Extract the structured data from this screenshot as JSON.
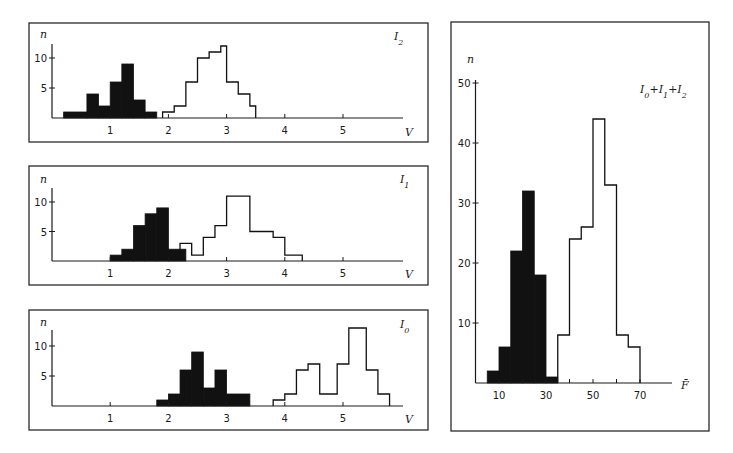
{
  "chart_data": [
    {
      "type": "bar",
      "title": "I2",
      "xlabel": "V",
      "ylabel": "n",
      "xlim": [
        0,
        6
      ],
      "ylim": [
        0,
        12
      ],
      "xticks": [
        1,
        2,
        3,
        4,
        5
      ],
      "yticks": [
        5,
        10
      ],
      "grid": false,
      "series": [
        {
          "name": "filled",
          "bins": [
            [
              0.2,
              0.6,
              1
            ],
            [
              0.6,
              0.8,
              4
            ],
            [
              0.8,
              1.0,
              2
            ],
            [
              1.0,
              1.2,
              6
            ],
            [
              1.2,
              1.4,
              9
            ],
            [
              1.4,
              1.6,
              3
            ],
            [
              1.6,
              1.8,
              1
            ]
          ]
        },
        {
          "name": "open",
          "bins": [
            [
              1.9,
              2.1,
              1
            ],
            [
              2.1,
              2.3,
              2
            ],
            [
              2.3,
              2.5,
              6
            ],
            [
              2.5,
              2.7,
              10
            ],
            [
              2.7,
              2.9,
              11
            ],
            [
              2.9,
              3.0,
              12
            ],
            [
              3.0,
              3.2,
              6
            ],
            [
              3.2,
              3.4,
              4
            ],
            [
              3.4,
              3.5,
              2
            ]
          ]
        }
      ]
    },
    {
      "type": "bar",
      "title": "I1",
      "xlabel": "V",
      "ylabel": "n",
      "xlim": [
        0,
        6
      ],
      "ylim": [
        0,
        12
      ],
      "xticks": [
        1,
        2,
        3,
        4,
        5
      ],
      "yticks": [
        5,
        10
      ],
      "grid": false,
      "series": [
        {
          "name": "filled",
          "bins": [
            [
              1.0,
              1.2,
              1
            ],
            [
              1.2,
              1.4,
              2
            ],
            [
              1.4,
              1.6,
              6
            ],
            [
              1.6,
              1.8,
              8
            ],
            [
              1.8,
              2.0,
              9
            ],
            [
              2.0,
              2.3,
              2
            ]
          ]
        },
        {
          "name": "open",
          "bins": [
            [
              2.2,
              2.4,
              3
            ],
            [
              2.4,
              2.6,
              1
            ],
            [
              2.6,
              2.8,
              4
            ],
            [
              2.8,
              3.0,
              6
            ],
            [
              3.0,
              3.4,
              11
            ],
            [
              3.4,
              3.8,
              5
            ],
            [
              3.8,
              4.0,
              4
            ],
            [
              4.0,
              4.3,
              1
            ]
          ]
        }
      ]
    },
    {
      "type": "bar",
      "title": "I0",
      "xlabel": "V",
      "ylabel": "n",
      "xlim": [
        0,
        6
      ],
      "ylim": [
        0,
        13
      ],
      "xticks": [
        1,
        2,
        3,
        4,
        5
      ],
      "yticks": [
        5,
        10
      ],
      "grid": false,
      "series": [
        {
          "name": "filled",
          "bins": [
            [
              1.8,
              2.0,
              1
            ],
            [
              2.0,
              2.2,
              2
            ],
            [
              2.2,
              2.4,
              6
            ],
            [
              2.4,
              2.6,
              9
            ],
            [
              2.6,
              2.8,
              3
            ],
            [
              2.8,
              3.0,
              6
            ],
            [
              3.0,
              3.4,
              2
            ]
          ]
        },
        {
          "name": "open",
          "bins": [
            [
              3.8,
              4.0,
              1
            ],
            [
              4.0,
              4.2,
              2
            ],
            [
              4.2,
              4.4,
              6
            ],
            [
              4.4,
              4.6,
              7
            ],
            [
              4.6,
              4.9,
              2
            ],
            [
              4.9,
              5.1,
              7
            ],
            [
              5.1,
              5.4,
              13
            ],
            [
              5.4,
              5.6,
              6
            ],
            [
              5.6,
              5.8,
              2
            ]
          ]
        }
      ]
    },
    {
      "type": "bar",
      "title": "I0+I1+I2",
      "xlabel": "F̄",
      "ylabel": "n",
      "xlim": [
        0,
        82
      ],
      "ylim": [
        0,
        50
      ],
      "xticks": [
        10,
        30,
        50,
        70
      ],
      "yticks": [
        10,
        20,
        30,
        40,
        50
      ],
      "grid": false,
      "series": [
        {
          "name": "filled",
          "bins": [
            [
              5,
              10,
              2
            ],
            [
              10,
              15,
              6
            ],
            [
              15,
              20,
              22
            ],
            [
              20,
              25,
              32
            ],
            [
              25,
              30,
              18
            ],
            [
              30,
              35,
              1
            ]
          ]
        },
        {
          "name": "open",
          "bins": [
            [
              35,
              40,
              8
            ],
            [
              40,
              45,
              24
            ],
            [
              45,
              50,
              26
            ],
            [
              50,
              55,
              44
            ],
            [
              55,
              60,
              33
            ],
            [
              60,
              65,
              8
            ],
            [
              65,
              70,
              6
            ]
          ]
        }
      ]
    }
  ],
  "panels": [
    {
      "label": "I",
      "sub": "2",
      "ylabel": "n",
      "xlabel": "V",
      "xticklabels": [
        "1",
        "2",
        "3",
        "4",
        "5"
      ],
      "yticklabels": [
        "5",
        "10"
      ]
    },
    {
      "label": "I",
      "sub": "1",
      "ylabel": "n",
      "xlabel": "V",
      "xticklabels": [
        "1",
        "2",
        "3",
        "4",
        "5"
      ],
      "yticklabels": [
        "5",
        "10"
      ]
    },
    {
      "label": "I",
      "sub": "0",
      "ylabel": "n",
      "xlabel": "V",
      "xticklabels": [
        "1",
        "2",
        "3",
        "4",
        "5"
      ],
      "yticklabels": [
        "5",
        "10"
      ]
    },
    {
      "label": "I0+I1+I2",
      "ylabel": "n",
      "xlabel": "F̄",
      "xticklabels": [
        "10",
        "30",
        "50",
        "70"
      ],
      "yticklabels": [
        "10",
        "20",
        "30",
        "40",
        "50"
      ]
    }
  ]
}
